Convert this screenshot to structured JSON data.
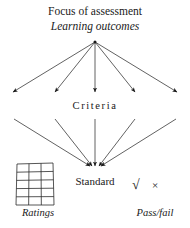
{
  "diagram": {
    "title_top": "Focus of assessment",
    "title_top_italic": "Learning outcomes",
    "middle_label": "Criteria",
    "bottom_label": "Standard",
    "ratings_caption": "Ratings",
    "passfail_caption": "Pass/fail",
    "check_mark": "√",
    "cross_mark": "×",
    "colors": {
      "background": "#ffffff",
      "ink": "#1a1a1a",
      "line": "#3a3a3a",
      "grid_line": "#2b2b2b"
    },
    "grid": {
      "columns": 3,
      "rows": 5
    },
    "upper_fan": {
      "apex": [
        95,
        42
      ],
      "arrow_tips": [
        [
          11,
          94
        ],
        [
          53,
          94
        ],
        [
          95,
          95
        ],
        [
          137,
          94
        ],
        [
          179,
          94
        ]
      ]
    },
    "criteria_axis": {
      "y": 106,
      "x_start": 5,
      "x_end": 185,
      "style": "dotted",
      "double_headed": true
    },
    "lower_fan": {
      "converge": [
        95,
        168
      ],
      "origins": [
        [
          14,
          119
        ],
        [
          55,
          119
        ],
        [
          95,
          119
        ],
        [
          135,
          119
        ],
        [
          176,
          119
        ]
      ]
    }
  }
}
